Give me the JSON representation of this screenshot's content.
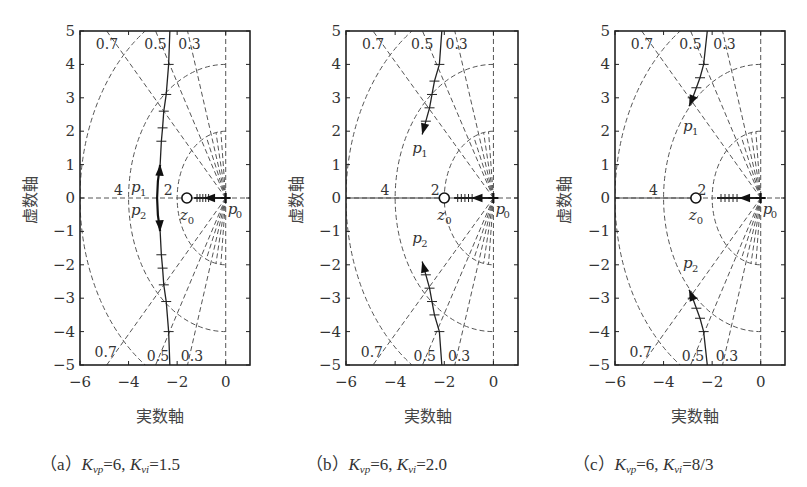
{
  "figure": {
    "panels": [
      {
        "id": "a",
        "caption_prefix": "（a）",
        "kvp_symbol": "K",
        "kvp_sub": "vp",
        "kvp_value": "=6,",
        "kvi_symbol": "K",
        "kvi_sub": "vi",
        "kvi_value": "=1.5",
        "xlabel": "実数軸",
        "ylabel": "虚数軸"
      },
      {
        "id": "b",
        "caption_prefix": "（b）",
        "kvp_symbol": "K",
        "kvp_sub": "vp",
        "kvp_value": "=6,",
        "kvi_symbol": "K",
        "kvi_sub": "vi",
        "kvi_value": "=2.0",
        "xlabel": "実数軸",
        "ylabel": "虚数軸"
      },
      {
        "id": "c",
        "caption_prefix": "（c）",
        "kvp_symbol": "K",
        "kvp_sub": "vp",
        "kvp_value": "=6,",
        "kvi_symbol": "K",
        "kvi_sub": "vi",
        "kvi_value": "=8/3",
        "xlabel": "実数軸",
        "ylabel": "虚数軸"
      }
    ]
  },
  "chart_data": [
    {
      "type": "scatter",
      "subtype": "root-locus",
      "title": "(a) Kvp=6, Kvi=1.5",
      "xlabel": "実数軸",
      "ylabel": "虚数軸",
      "xlim": [
        -6,
        1
      ],
      "ylim": [
        -5,
        5
      ],
      "xticks": [
        -6,
        -4,
        -2,
        0
      ],
      "yticks": [
        -5,
        -4,
        -3,
        -2,
        -1,
        0,
        1,
        2,
        3,
        4,
        5
      ],
      "grid": "s-plane damping ratio lines (0.3, 0.5, 0.7) and natural frequency circles (2, 4, 6), dashed",
      "damping_labels_top": [
        "0.7",
        "0.5",
        "0.3"
      ],
      "damping_labels_bottom": [
        "0.7",
        "0.5",
        "0.3"
      ],
      "frequency_labels": [
        "4",
        "2"
      ],
      "zero": {
        "label": "z0",
        "x": -1.6,
        "y": 0
      },
      "pole_origin": {
        "label": "p0",
        "x": 0,
        "y": 0
      },
      "poles_labels": [
        "p1",
        "p2",
        "z0",
        "p0"
      ],
      "loci": [
        {
          "name": "p1 branch",
          "points": [
            [
              -2.7,
              1.0
            ],
            [
              -2.65,
              1.7
            ],
            [
              -2.6,
              2.1
            ],
            [
              -2.55,
              2.6
            ],
            [
              -2.45,
              3.1
            ],
            [
              -2.35,
              4.0
            ],
            [
              -2.3,
              5.0
            ]
          ]
        },
        {
          "name": "p2 branch",
          "points": [
            [
              -2.7,
              -1.0
            ],
            [
              -2.65,
              -1.7
            ],
            [
              -2.6,
              -2.1
            ],
            [
              -2.55,
              -2.6
            ],
            [
              -2.45,
              -3.1
            ],
            [
              -2.35,
              -4.0
            ],
            [
              -2.3,
              -5.0
            ]
          ]
        },
        {
          "name": "real branch",
          "points": [
            [
              -1.3,
              0
            ],
            [
              0,
              0
            ]
          ]
        }
      ],
      "p1_start": [
        -2.7,
        1.0
      ],
      "p2_start": [
        -2.7,
        -1.0
      ]
    },
    {
      "type": "scatter",
      "subtype": "root-locus",
      "title": "(b) Kvp=6, Kvi=2.0",
      "xlabel": "実数軸",
      "ylabel": "虚数軸",
      "xlim": [
        -6,
        1
      ],
      "ylim": [
        -5,
        5
      ],
      "xticks": [
        -6,
        -4,
        -2,
        0
      ],
      "yticks": [
        -5,
        -4,
        -3,
        -2,
        -1,
        0,
        1,
        2,
        3,
        4,
        5
      ],
      "damping_labels_top": [
        "0.7",
        "0.5",
        "0.3"
      ],
      "damping_labels_bottom": [
        "0.7",
        "0.5",
        "0.3"
      ],
      "frequency_labels": [
        "4",
        "2"
      ],
      "zero": {
        "label": "z0",
        "x": -2.0,
        "y": 0
      },
      "pole_origin": {
        "label": "p0",
        "x": 0,
        "y": 0
      },
      "loci": [
        {
          "name": "p1 branch",
          "points": [
            [
              -2.9,
              1.9
            ],
            [
              -2.75,
              2.3
            ],
            [
              -2.6,
              2.7
            ],
            [
              -2.5,
              3.1
            ],
            [
              -2.4,
              3.5
            ],
            [
              -2.2,
              4.0
            ],
            [
              -2.1,
              5.0
            ]
          ]
        },
        {
          "name": "p2 branch",
          "points": [
            [
              -2.9,
              -1.9
            ],
            [
              -2.75,
              -2.3
            ],
            [
              -2.6,
              -2.7
            ],
            [
              -2.5,
              -3.1
            ],
            [
              -2.4,
              -3.5
            ],
            [
              -2.2,
              -4.0
            ],
            [
              -2.1,
              -5.0
            ]
          ]
        },
        {
          "name": "real branch",
          "points": [
            [
              -1.6,
              0
            ],
            [
              0,
              0
            ]
          ]
        }
      ]
    },
    {
      "type": "scatter",
      "subtype": "root-locus",
      "title": "(c) Kvp=6, Kvi=8/3",
      "xlabel": "実数軸",
      "ylabel": "虚数軸",
      "xlim": [
        -6,
        1
      ],
      "ylim": [
        -5,
        5
      ],
      "xticks": [
        -6,
        -4,
        -2,
        0
      ],
      "yticks": [
        -5,
        -4,
        -3,
        -2,
        -1,
        0,
        1,
        2,
        3,
        4,
        5
      ],
      "damping_labels_top": [
        "0.7",
        "0.5",
        "0.3"
      ],
      "damping_labels_bottom": [
        "0.7",
        "0.5",
        "0.3"
      ],
      "frequency_labels": [
        "4",
        "2"
      ],
      "zero": {
        "label": "z0",
        "x": -2.67,
        "y": 0
      },
      "pole_origin": {
        "label": "p0",
        "x": 0,
        "y": 0
      },
      "loci": [
        {
          "name": "p1 branch",
          "points": [
            [
              -2.95,
              2.75
            ],
            [
              -2.8,
              3.0
            ],
            [
              -2.65,
              3.3
            ],
            [
              -2.5,
              3.6
            ],
            [
              -2.35,
              4.0
            ],
            [
              -2.2,
              5.0
            ]
          ]
        },
        {
          "name": "p2 branch",
          "points": [
            [
              -2.95,
              -2.75
            ],
            [
              -2.8,
              -3.0
            ],
            [
              -2.65,
              -3.3
            ],
            [
              -2.5,
              -3.6
            ],
            [
              -2.35,
              -4.0
            ],
            [
              -2.2,
              -5.0
            ]
          ]
        },
        {
          "name": "real branch",
          "points": [
            [
              -1.8,
              0
            ],
            [
              0,
              0
            ]
          ]
        }
      ]
    }
  ],
  "layout": {
    "plots": [
      {
        "left": 80,
        "right": 250,
        "top": 31,
        "bottom": 365
      },
      {
        "left": 346,
        "right": 518,
        "top": 31,
        "bottom": 365
      },
      {
        "left": 615,
        "right": 785,
        "top": 31,
        "bottom": 365
      }
    ]
  }
}
